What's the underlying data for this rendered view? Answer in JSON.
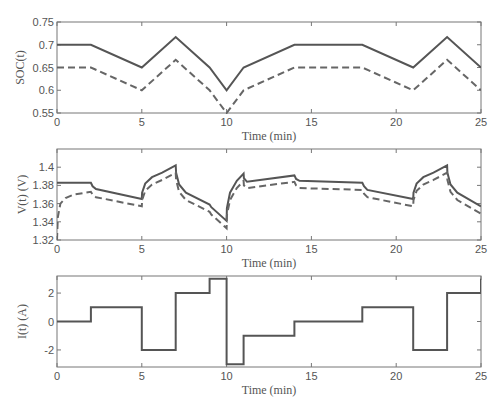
{
  "figure": {
    "width": 502,
    "height": 413,
    "line_color": "#555555",
    "dashed_color": "#666666",
    "axis_color": "#777777"
  },
  "chart_data": [
    {
      "type": "line",
      "title": "",
      "xlabel": "Time (min)",
      "ylabel": "SOC(t)",
      "xlim": [
        0,
        25
      ],
      "ylim": [
        0.55,
        0.75
      ],
      "xticks": [
        0,
        5,
        10,
        15,
        20,
        25
      ],
      "yticks": [
        0.55,
        0.6,
        0.65,
        0.7,
        0.75
      ],
      "ytick_labels": [
        "0.55",
        "0.6",
        "0.65",
        "0.7",
        "0.75"
      ],
      "grid": false,
      "legend": null,
      "series": [
        {
          "name": "solid",
          "style": "solid",
          "x": [
            0,
            2,
            5,
            7,
            9,
            10,
            11,
            14,
            18,
            21,
            23,
            25
          ],
          "y": [
            0.7,
            0.7,
            0.65,
            0.717,
            0.65,
            0.6,
            0.65,
            0.7,
            0.7,
            0.65,
            0.717,
            0.65
          ]
        },
        {
          "name": "dashed",
          "style": "dashed",
          "x": [
            0,
            2,
            5,
            7,
            9,
            10,
            11,
            14,
            18,
            21,
            23,
            25
          ],
          "y": [
            0.65,
            0.65,
            0.6,
            0.667,
            0.6,
            0.55,
            0.6,
            0.65,
            0.65,
            0.6,
            0.667,
            0.6
          ]
        }
      ]
    },
    {
      "type": "line",
      "title": "",
      "xlabel": "Time (min)",
      "ylabel": "V(t) (V)",
      "xlim": [
        0,
        25
      ],
      "ylim": [
        1.32,
        1.42
      ],
      "xticks": [
        0,
        5,
        10,
        15,
        20,
        25
      ],
      "yticks": [
        1.32,
        1.34,
        1.36,
        1.38,
        1.4
      ],
      "ytick_labels": [
        "1.32",
        "1.34",
        "1.36",
        "1.38",
        "1.4"
      ],
      "grid": false,
      "legend": null,
      "series": [
        {
          "name": "solid",
          "style": "solid",
          "x": [
            0,
            2,
            2.1,
            2.3,
            5,
            5.02,
            5.2,
            5.6,
            6.2,
            7,
            7.02,
            7.2,
            7.6,
            9,
            9.1,
            10,
            10.02,
            10.2,
            10.6,
            11,
            11.02,
            11.2,
            14,
            14.1,
            14.3,
            18,
            18.1,
            18.3,
            21,
            21.02,
            21.2,
            21.6,
            22.2,
            23,
            23.02,
            23.2,
            23.6,
            25
          ],
          "y": [
            1.383,
            1.383,
            1.379,
            1.376,
            1.365,
            1.372,
            1.382,
            1.389,
            1.394,
            1.402,
            1.394,
            1.381,
            1.372,
            1.359,
            1.356,
            1.341,
            1.355,
            1.372,
            1.385,
            1.393,
            1.388,
            1.384,
            1.391,
            1.387,
            1.385,
            1.383,
            1.379,
            1.375,
            1.365,
            1.372,
            1.382,
            1.389,
            1.394,
            1.402,
            1.394,
            1.381,
            1.372,
            1.357
          ]
        },
        {
          "name": "dashed",
          "style": "dashed",
          "x": [
            0,
            0.05,
            0.2,
            0.5,
            1,
            2,
            2.1,
            2.3,
            5,
            5.02,
            5.2,
            5.6,
            6.2,
            7,
            7.02,
            7.2,
            7.6,
            9,
            9.1,
            10,
            10.02,
            10.2,
            10.6,
            11,
            11.02,
            11.2,
            14,
            14.1,
            14.3,
            18,
            18.1,
            18.3,
            21,
            21.02,
            21.2,
            21.6,
            22.2,
            23,
            23.02,
            23.2,
            23.6,
            25
          ],
          "y": [
            1.32,
            1.345,
            1.36,
            1.366,
            1.37,
            1.373,
            1.37,
            1.367,
            1.357,
            1.364,
            1.374,
            1.381,
            1.386,
            1.394,
            1.386,
            1.373,
            1.364,
            1.351,
            1.348,
            1.333,
            1.347,
            1.364,
            1.377,
            1.385,
            1.38,
            1.377,
            1.384,
            1.38,
            1.377,
            1.375,
            1.371,
            1.367,
            1.357,
            1.364,
            1.374,
            1.381,
            1.386,
            1.394,
            1.386,
            1.373,
            1.364,
            1.349
          ]
        }
      ]
    },
    {
      "type": "line",
      "title": "",
      "xlabel": "Time (min)",
      "ylabel": "I(t) (A)",
      "xlim": [
        0,
        25
      ],
      "ylim": [
        -3.2,
        3.2
      ],
      "xticks": [
        0,
        5,
        10,
        15,
        20,
        25
      ],
      "yticks": [
        -2,
        0,
        2
      ],
      "ytick_labels": [
        "-2",
        "0",
        "2"
      ],
      "grid": false,
      "legend": null,
      "series": [
        {
          "name": "current",
          "style": "step",
          "x": [
            0,
            2,
            2,
            5,
            5,
            7,
            7,
            9,
            9,
            10,
            10,
            11,
            11,
            14,
            14,
            18,
            18,
            21,
            21,
            23,
            23,
            25,
            25
          ],
          "y": [
            0,
            0,
            1,
            1,
            -2,
            -2,
            2,
            2,
            3,
            3,
            -3,
            -3,
            -1,
            -1,
            0,
            0,
            1,
            1,
            -2,
            -2,
            2,
            2,
            3
          ]
        }
      ]
    }
  ]
}
